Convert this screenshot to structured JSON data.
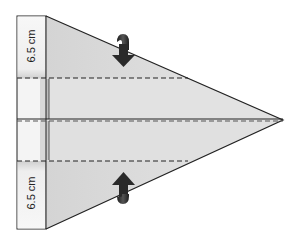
{
  "diagram": {
    "type": "paper-airplane-fold-step",
    "labels": {
      "top_measure": "6.5 cm",
      "bottom_measure": "6.5 cm"
    },
    "fold_lines": [
      "upper-dashed-fold",
      "center-crease",
      "lower-dashed-fold"
    ],
    "arrows": [
      {
        "name": "fold-down-arrow",
        "direction": "down"
      },
      {
        "name": "fold-up-arrow",
        "direction": "up"
      }
    ],
    "colors": {
      "paper": "#dcdcdc",
      "paper_light": "#f2f2f2",
      "outline": "#222222",
      "arrow": "#333333"
    }
  }
}
